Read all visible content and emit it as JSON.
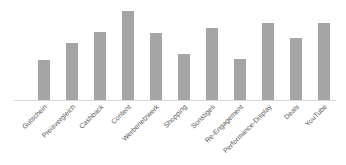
{
  "chart_data": {
    "type": "bar",
    "title": "",
    "xlabel": "",
    "ylabel": "",
    "categories": [
      "Gutschein",
      "Preisvergleich",
      "Cashback",
      "Content",
      "Werbenetzwerk",
      "Shopping",
      "Sonstiges",
      "Re-Engagement",
      "Performance-Display",
      "Deals",
      "YouTube"
    ],
    "values": [
      40,
      57,
      68,
      89,
      67,
      46,
      72,
      41,
      77,
      62,
      77
    ],
    "ylim": [
      0,
      100
    ],
    "grid": false,
    "legend": "none",
    "y_axis_visible": false,
    "bar_color": "#a5a5a5",
    "axis_color": "#d9d9d9",
    "label_color": "#595959",
    "label_rotation": -45
  },
  "layout": {
    "baseline_y": 100,
    "baseline_x0": 14,
    "baseline_x1": 336,
    "first_bar_center": 44,
    "bar_spacing": 28,
    "bar_width": 12,
    "px_per_unit": 1
  }
}
